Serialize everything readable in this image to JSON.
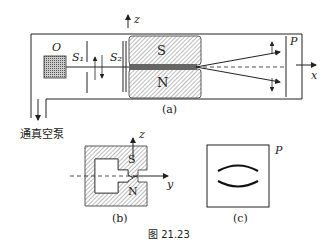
{
  "labels": {
    "source": "O",
    "slit1": "S₁",
    "slit2": "S₂",
    "magnet_s": "S",
    "magnet_n": "N",
    "screen": "P",
    "axis_x": "x",
    "axis_y": "y",
    "axis_z_a": "z",
    "axis_z_b": "z",
    "pump": "通真空泵",
    "panel_a": "(a)",
    "panel_b": "(b)",
    "panel_c": "(c)",
    "screen_c": "P",
    "magnet_s_b": "S",
    "magnet_n_b": "N"
  },
  "caption": "图 21.23",
  "colors": {
    "line": "#222222",
    "hatch": "#555555",
    "source_fill": "#888888"
  }
}
